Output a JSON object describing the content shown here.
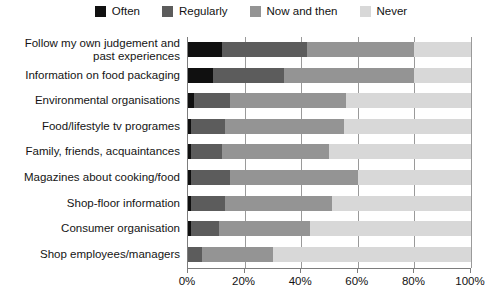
{
  "chart_data": {
    "type": "bar",
    "subtype": "stacked-horizontal-bar",
    "title": "",
    "xlabel": "",
    "ylabel": "",
    "xlim": [
      0,
      100
    ],
    "xticks": [
      "0%",
      "20%",
      "40%",
      "60%",
      "80%",
      "100%"
    ],
    "xtick_values": [
      0,
      20,
      40,
      60,
      80,
      100
    ],
    "grid": true,
    "grid_axis": "x",
    "legend_position": "top-center",
    "stack_order": [
      "Often",
      "Regularly",
      "Now and then",
      "Never"
    ],
    "series": [
      {
        "name": "Often",
        "color": "#101010",
        "values": [
          12,
          9,
          2,
          1,
          1,
          1,
          1,
          1,
          0
        ]
      },
      {
        "name": "Regularly",
        "color": "#5c5c5c",
        "values": [
          30,
          25,
          13,
          12,
          11,
          14,
          12,
          10,
          5
        ]
      },
      {
        "name": "Now and then",
        "color": "#949494",
        "values": [
          38,
          46,
          41,
          42,
          38,
          45,
          38,
          32,
          25
        ]
      },
      {
        "name": "Never",
        "color": "#d8d8d8",
        "values": [
          20,
          20,
          44,
          45,
          50,
          40,
          49,
          57,
          70
        ]
      }
    ],
    "categories": [
      "Follow my own judgement and past experiences",
      "Information on food packaging",
      "Environmental organisations",
      "Food/lifestyle tv programes",
      "Family, friends, acquaintances",
      "Magazines about cooking/food",
      "Shop-floor information",
      "Consumer organisation",
      "Shop employees/managers"
    ],
    "category_lines": [
      [
        "Follow my own judgement and",
        "past experiences"
      ],
      [
        "Information on food packaging"
      ],
      [
        "Environmental organisations"
      ],
      [
        "Food/lifestyle tv programes"
      ],
      [
        "Family, friends, acquaintances"
      ],
      [
        "Magazines about cooking/food"
      ],
      [
        "Shop-floor information"
      ],
      [
        "Consumer organisation"
      ],
      [
        "Shop employees/managers"
      ]
    ]
  },
  "legend": {
    "items": [
      {
        "label": "Often",
        "color": "#101010"
      },
      {
        "label": "Regularly",
        "color": "#5c5c5c"
      },
      {
        "label": "Now and then",
        "color": "#949494"
      },
      {
        "label": "Never",
        "color": "#d8d8d8"
      }
    ]
  },
  "axis": {
    "ticks": [
      {
        "label": "0%",
        "value": 0
      },
      {
        "label": "20%",
        "value": 20
      },
      {
        "label": "40%",
        "value": 40
      },
      {
        "label": "60%",
        "value": 60
      },
      {
        "label": "80%",
        "value": 80
      },
      {
        "label": "100%",
        "value": 100
      }
    ]
  },
  "geometry": {
    "plot_left": 187,
    "plot_right": 470,
    "plot_top": 37,
    "plot_bottom": 268,
    "row_height": 25.6,
    "bar_height": 15,
    "first_bar_top": 42
  }
}
